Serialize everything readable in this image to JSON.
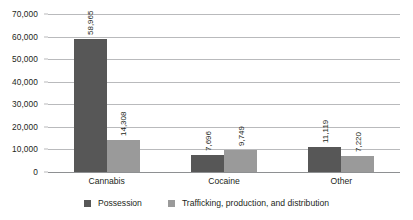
{
  "chart_data": {
    "type": "bar",
    "title": "",
    "subtitle": "",
    "xlabel": "",
    "ylabel": "",
    "categories": [
      "Cannabis",
      "Cocaine",
      "Other"
    ],
    "series": [
      {
        "name": "Possession",
        "color": "#575757",
        "values": [
          58965,
          7696,
          11119
        ],
        "labels": [
          "58,965",
          "7,696",
          "11,119"
        ]
      },
      {
        "name": "Trafficking, production, and distribution",
        "color": "#9a9a9a",
        "values": [
          14308,
          9749,
          7220
        ],
        "labels": [
          "14,308",
          "9,749",
          "7,220"
        ]
      }
    ],
    "ylim": [
      0,
      70000
    ],
    "ytick_values": [
      0,
      10000,
      20000,
      30000,
      40000,
      50000,
      60000,
      70000
    ],
    "ytick_labels": [
      "0",
      "10,000",
      "20,000",
      "30,000",
      "40,000",
      "50,000",
      "60,000",
      "70,000"
    ],
    "grid": true,
    "grid_axis": "y",
    "grid_color": "#b9babc",
    "legend_position": "bottom",
    "background": "#ffffff",
    "data_labels": true,
    "data_label_orientation": "vertical"
  },
  "legend": {
    "items": [
      {
        "label": "Possession",
        "color": "#575757"
      },
      {
        "label": "Trafficking, production, and distribution",
        "color": "#9a9a9a"
      }
    ]
  }
}
